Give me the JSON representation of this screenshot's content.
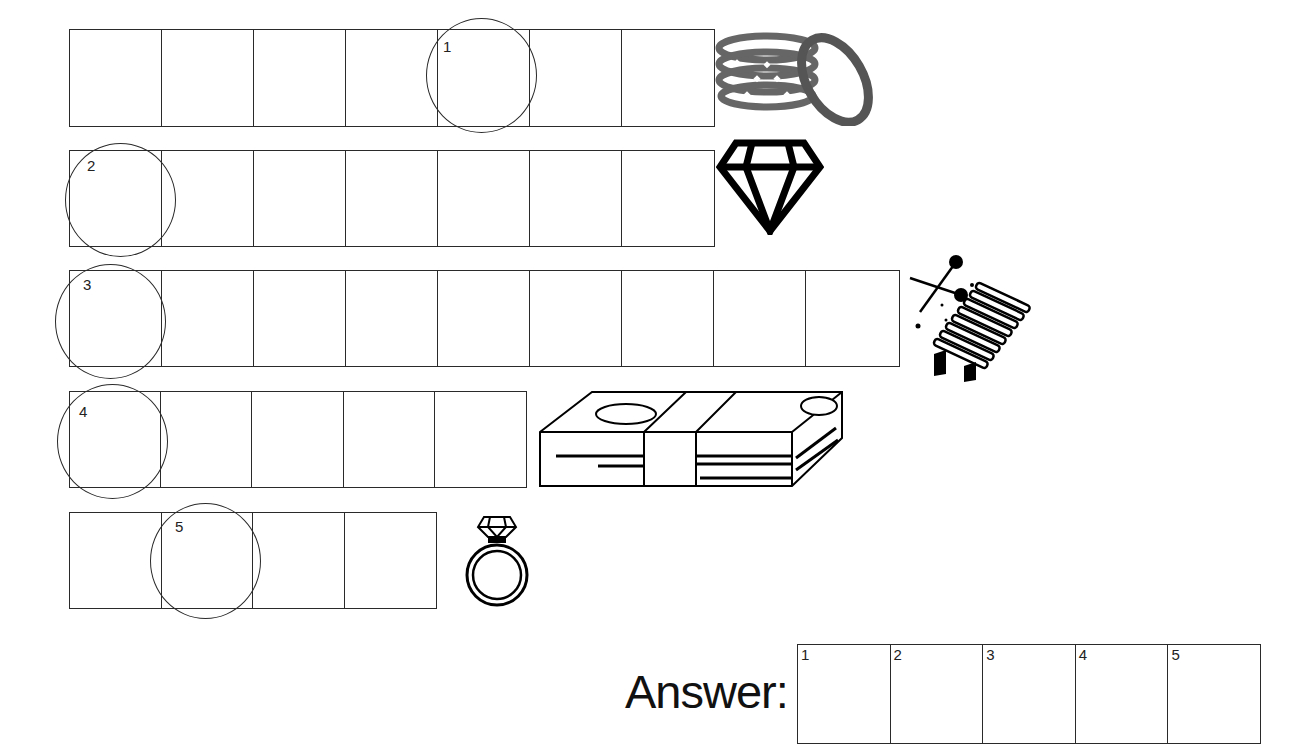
{
  "puzzle": {
    "rows": [
      {
        "index": 1,
        "cells": 7,
        "circled_cell": 5,
        "clue_number": "1",
        "picture": "bangles-icon"
      },
      {
        "index": 2,
        "cells": 7,
        "circled_cell": 1,
        "clue_number": "2",
        "picture": "diamond-icon"
      },
      {
        "index": 3,
        "cells": 9,
        "circled_cell": 1,
        "clue_number": "3",
        "picture": "xylophone-icon"
      },
      {
        "index": 4,
        "cells": 5,
        "circled_cell": 1,
        "clue_number": "4",
        "picture": "money-stack-icon"
      },
      {
        "index": 5,
        "cells": 4,
        "circled_cell": 2,
        "clue_number": "5",
        "picture": "ring-icon"
      }
    ]
  },
  "answer": {
    "label": "Answer:",
    "boxes": [
      "1",
      "2",
      "3",
      "4",
      "5"
    ]
  }
}
